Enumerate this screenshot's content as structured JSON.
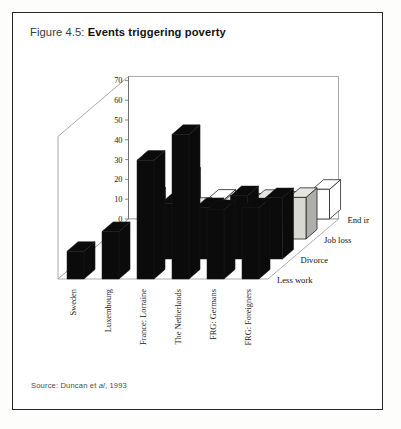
{
  "figure": {
    "label": "Figure 4.5:",
    "title": "Events triggering poverty"
  },
  "source": {
    "prefix": "Source: Duncan et ",
    "italic": "al",
    "suffix": ", 1993"
  },
  "colors": {
    "frame": "#23262b",
    "page_background": "#ffffff",
    "bar_less_work": "#0b0b0b",
    "bar_divorce": "#0b0b0b",
    "bar_job_loss": "#d9d9d4",
    "bar_end_insurance": "#ffffff",
    "bar_outline": "#1a1a1a",
    "axis": "#6b6b6b",
    "text": "#1a1a1a"
  },
  "chart_data": {
    "type": "bar",
    "title": "Events triggering poverty",
    "subtitle": "",
    "xlabel": "",
    "ylabel": "% poor affected",
    "zlabel": "",
    "ylim": [
      0,
      75
    ],
    "yticks": [
      0,
      10,
      20,
      30,
      40,
      50,
      60,
      70
    ],
    "grid": false,
    "legend_position": "right-depth-axis",
    "projection": "3d",
    "categories": [
      "Sweden",
      "Luxembourg",
      "France: Lorraine",
      "The Netherlands",
      "FRG: Germans",
      "FRG: Foreigners"
    ],
    "series": [
      {
        "name": "Less work",
        "fill": "black",
        "values": [
          14,
          24,
          60,
          73,
          35,
          36
        ]
      },
      {
        "name": "Divorce",
        "fill": "black",
        "values": [
          0,
          0,
          28,
          26,
          32,
          31
        ]
      },
      {
        "name": "Job loss",
        "fill": "gray",
        "values": [
          0,
          0,
          16,
          17,
          20,
          21
        ]
      },
      {
        "name": "End insurance",
        "fill": "white",
        "values": [
          11,
          21,
          10,
          8,
          9,
          15
        ]
      }
    ]
  }
}
